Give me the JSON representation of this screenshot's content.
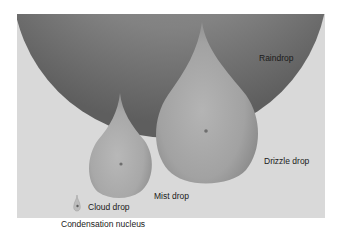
{
  "diagram": {
    "type": "size comparison of water droplets",
    "panel_background": "#d9d9d9",
    "drops": [
      {
        "id": "raindrop",
        "label": "Raindrop",
        "shape": "large sphere (partially shown)",
        "color": "#7d7d7d"
      },
      {
        "id": "drizzle",
        "label": "Drizzle drop",
        "shape": "teardrop",
        "color": "#a0a0a0"
      },
      {
        "id": "mist",
        "label": "Mist drop",
        "shape": "teardrop",
        "color": "#a8a8a8"
      },
      {
        "id": "cloud",
        "label": "Cloud drop",
        "shape": "tiny teardrop",
        "color": "#a8a8a8"
      },
      {
        "id": "nucleus",
        "label": "Condensation nucleus",
        "shape": "dot",
        "color": "#7a7a7a"
      }
    ]
  },
  "labels": {
    "raindrop": "Raindrop",
    "drizzle": "Drizzle drop",
    "mist": "Mist drop",
    "cloud": "Cloud drop",
    "nucleus": "Condensation nucleus"
  }
}
